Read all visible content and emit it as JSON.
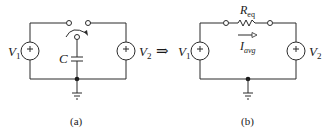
{
  "diagram": {
    "type": "circuit-equivalence",
    "arrow": "⇒",
    "circuit_a": {
      "caption": "(a)",
      "sources": [
        {
          "name": "V",
          "subscript": "1",
          "polarity": "+"
        },
        {
          "name": "V",
          "subscript": "2",
          "polarity": "+"
        }
      ],
      "capacitor": {
        "label": "C"
      },
      "switch": {
        "type": "SPDT",
        "direction": "clockwise"
      },
      "ground": true
    },
    "circuit_b": {
      "caption": "(b)",
      "sources": [
        {
          "name": "V",
          "subscript": "1",
          "polarity": "+"
        },
        {
          "name": "V",
          "subscript": "2",
          "polarity": "+"
        }
      ],
      "resistor": {
        "name": "R",
        "subscript": "eq"
      },
      "current": {
        "name": "I",
        "subscript": "avg"
      },
      "ground": true
    }
  }
}
